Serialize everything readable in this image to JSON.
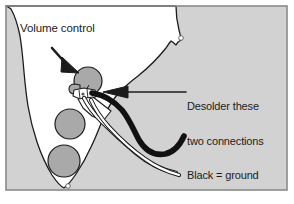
{
  "figure": {
    "type": "diagram",
    "width": 294,
    "height": 204,
    "background_color": "#ffffff",
    "frame_color": "#8a8a8a"
  },
  "annotations": {
    "volume_control": {
      "text": "Volume control",
      "arrow": "points down-right to the volume potentiometer"
    },
    "desolder": {
      "line1": "Desolder these",
      "line2": "two connections",
      "line3": "Black = ground",
      "line4": "White = signal",
      "arrow": "points left to the two solder lugs on the volume pot"
    }
  },
  "parts": {
    "body": {
      "name": "guitar-body",
      "color": "#d2d2d2",
      "outline_color": "#1c1c1c"
    },
    "cavity": {
      "name": "control-cavity",
      "color": "#ffffff",
      "outline_color": "#1c1c1c"
    },
    "pots": [
      {
        "name": "volume-pot",
        "color": "#a9a9a9",
        "cx": 88,
        "cy": 82,
        "r": 14
      },
      {
        "name": "tone-pot-1",
        "color": "#a9a9a9",
        "cx": 70,
        "cy": 124,
        "r": 15
      },
      {
        "name": "tone-pot-2",
        "color": "#a9a9a9",
        "cx": 64,
        "cy": 161,
        "r": 16
      }
    ],
    "screws": [
      {
        "name": "screw-hole-top",
        "cx": 181,
        "cy": 38,
        "r": 2
      },
      {
        "name": "screw-hole-bottom",
        "cx": 68,
        "cy": 186,
        "r": 2
      }
    ],
    "wires": [
      {
        "name": "black-wire",
        "label": "Black = ground",
        "color": "#111111"
      },
      {
        "name": "white-wire",
        "label": "White = signal",
        "color": "#ffffff",
        "outline_color": "#1c1c1c"
      }
    ],
    "lugs": {
      "name": "solder-lugs",
      "color": "#ffffff",
      "outline_color": "#1c1c1c"
    }
  }
}
